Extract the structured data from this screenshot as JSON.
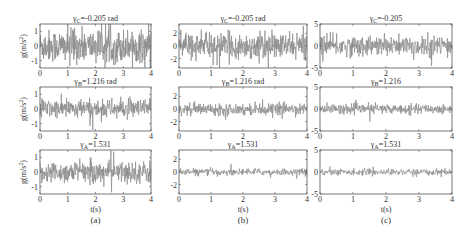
{
  "chart_data": {
    "type": "line",
    "layout": "3x3 grid of time-series subplots",
    "line_color": "#8a8a8a",
    "frame_color": "#555555",
    "xlabel": "t(s)",
    "ylabel": "g(m/s^2)",
    "xlim": [
      0,
      4
    ],
    "x_ticks": [
      "0",
      "1",
      "2",
      "3",
      "4"
    ],
    "columns": [
      {
        "caption": "(a)",
        "ylim": [
          -1.5,
          1.5
        ],
        "y_ticks": [
          {
            "v": 1,
            "label": "1"
          },
          {
            "v": 0,
            "label": "0"
          },
          {
            "v": -1,
            "label": "-1"
          }
        ],
        "show_ylabel": true,
        "rows": [
          {
            "title": "γC=-0.205 rad",
            "amplitude": 1.2,
            "density": "high"
          },
          {
            "title": "γB=1.216 rad",
            "amplitude": 0.7,
            "density": "medium"
          },
          {
            "title": "γA=1.531",
            "amplitude": 0.8,
            "density": "medium"
          }
        ]
      },
      {
        "caption": "(b)",
        "ylim": [
          -3.5,
          3.5
        ],
        "y_ticks": [
          {
            "v": 2,
            "label": "2"
          },
          {
            "v": 0,
            "label": "0"
          },
          {
            "v": -2,
            "label": "-2"
          }
        ],
        "show_ylabel": false,
        "rows": [
          {
            "title": "γC=-0.205 rad",
            "amplitude": 2.2,
            "density": "high"
          },
          {
            "title": "γB=1.216 rad",
            "amplitude": 1.0,
            "density": "medium"
          },
          {
            "title": "γA=1.531",
            "amplitude": 0.6,
            "density": "low"
          }
        ]
      },
      {
        "caption": "(c)",
        "ylim": [
          -5,
          5
        ],
        "y_ticks": [
          {
            "v": 5,
            "label": "5"
          },
          {
            "v": 0,
            "label": "0"
          },
          {
            "v": -5,
            "label": "-5"
          }
        ],
        "show_ylabel": false,
        "rows": [
          {
            "title": "γC=-0.205",
            "amplitude": 2.5,
            "density": "high"
          },
          {
            "title": "γB=1.216",
            "amplitude": 1.2,
            "density": "medium"
          },
          {
            "title": "γA=1.531",
            "amplitude": 0.8,
            "density": "low"
          }
        ]
      }
    ]
  }
}
